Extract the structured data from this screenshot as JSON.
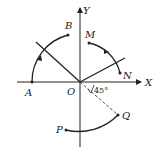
{
  "diagram": {
    "type": "coordinate-plane",
    "axes": {
      "x_label": "X",
      "y_label": "Y",
      "origin_label": "O"
    },
    "points": {
      "A": "A",
      "B": "B",
      "M": "M",
      "N": "N",
      "P": "P",
      "Q": "Q"
    },
    "angle_label": "45°",
    "colors": {
      "stroke": "#222222",
      "background": "#ffffff"
    }
  }
}
